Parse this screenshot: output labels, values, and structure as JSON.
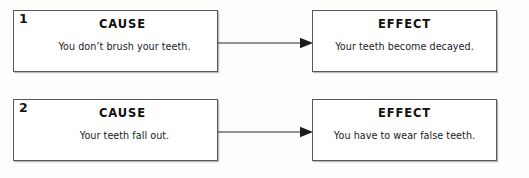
{
  "worksheet": {
    "rows": [
      {
        "number": "1",
        "cause": {
          "heading": "CAUSE",
          "body": "You don’t brush your teeth."
        },
        "connector": {
          "icon": "arrow-right-icon",
          "direction": "right"
        },
        "effect": {
          "heading": "EFFECT",
          "body": "Your teeth become decayed."
        }
      },
      {
        "number": "2",
        "cause": {
          "heading": "CAUSE",
          "body": "Your teeth fall out."
        },
        "connector": {
          "icon": "arrow-right-icon",
          "direction": "right"
        },
        "effect": {
          "heading": "EFFECT",
          "body": "You have to wear false teeth."
        }
      }
    ]
  },
  "colors": {
    "page_background": "#fdfdfb",
    "box_background": "#ffffff",
    "box_border": "#58585a",
    "box_shadow": "#b9b9bb",
    "text": "#1a1a1a",
    "arrow": "#2b2b2b"
  }
}
